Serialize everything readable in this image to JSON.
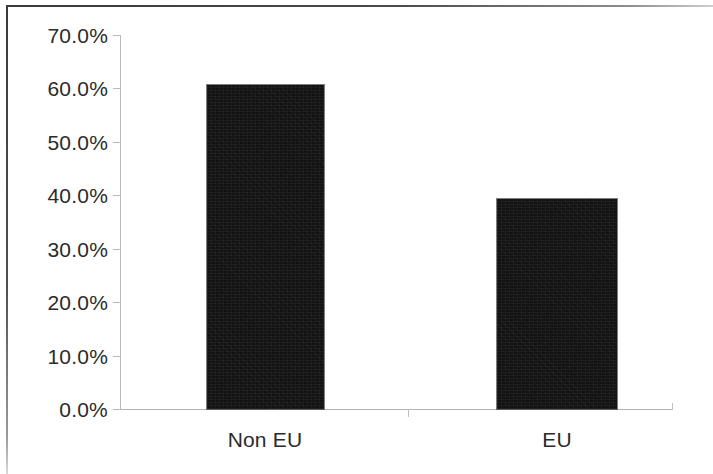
{
  "chart_data": {
    "type": "bar",
    "title": "",
    "subtitle": "",
    "xlabel": "",
    "ylabel": "",
    "categories": [
      "Non EU",
      "EU"
    ],
    "values": [
      60.7,
      39.3
    ],
    "value_labels": [
      "60.7%",
      "39.3%"
    ],
    "ylim": [
      0,
      70
    ],
    "y_tick_labels": [
      "70.0%",
      "60.0%",
      "50.0%",
      "40.0%",
      "30.0%",
      "20.0%",
      "10.0%",
      "0.0%"
    ],
    "y_tick_values": [
      70,
      60,
      50,
      40,
      30,
      20,
      10,
      0
    ],
    "grid": false,
    "legend": false,
    "legend_position": "none",
    "series": [
      {
        "name": "",
        "color": "#121212",
        "values": [
          60.7,
          39.3
        ]
      }
    ]
  },
  "axis": {
    "y_ticks": [
      {
        "label": "70.0%",
        "value": 70
      },
      {
        "label": "60.0%",
        "value": 60
      },
      {
        "label": "50.0%",
        "value": 50
      },
      {
        "label": "40.0%",
        "value": 40
      },
      {
        "label": "30.0%",
        "value": 30
      },
      {
        "label": "20.0%",
        "value": 20
      },
      {
        "label": "10.0%",
        "value": 10
      },
      {
        "label": "0.0%",
        "value": 0
      }
    ],
    "x_categories": [
      {
        "label": "Non EU"
      },
      {
        "label": "EU"
      }
    ]
  },
  "colors": {
    "bar": "#121212",
    "axis": "#b9b9b9",
    "text": "#2b2b2b",
    "background": "#ffffff",
    "frame": "#3a3a3a"
  }
}
